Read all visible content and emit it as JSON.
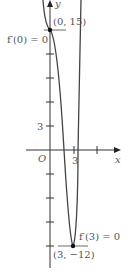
{
  "figure": {
    "axes": {
      "x_label": "x",
      "y_label": "y",
      "origin_label": "O",
      "x_tick_label": "3",
      "y_tick_label": "3"
    },
    "points": [
      {
        "label": "(0, 15)",
        "annotation": "f′(0) = 0",
        "x": 0,
        "y": 15
      },
      {
        "label": "(3, −12)",
        "annotation": "f′(3) = 0",
        "x": 3,
        "y": -12
      }
    ],
    "colors": {
      "curve": "#444444",
      "axis": "#333333",
      "text": "#555555"
    }
  }
}
